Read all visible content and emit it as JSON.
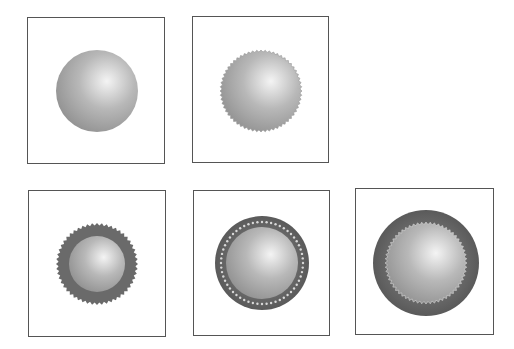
{
  "figure": {
    "colors": {
      "frame": "#555555",
      "sphere_highlight": "#f4f4f4",
      "sphere_mid": "#b8b8b8",
      "sphere_shadow": "#8a8a8a",
      "ring_dark": "#6a6a6a",
      "dot_light": "#d8d8d8"
    },
    "panels": [
      {
        "id": "plain-sphere",
        "box": [
          27,
          17,
          138,
          147
        ],
        "cx": 69,
        "cy": 73,
        "outer_r": 41,
        "inner_r": 0,
        "style": "smooth"
      },
      {
        "id": "serrated-sphere",
        "box": [
          192,
          16,
          137,
          147
        ],
        "cx": 68,
        "cy": 74,
        "outer_r": 41,
        "inner_r": 0,
        "style": "serrated"
      },
      {
        "id": "serrated-ring-small-core",
        "box": [
          28,
          190,
          138,
          147
        ],
        "cx": 68,
        "cy": 73,
        "outer_r": 41,
        "inner_r": 28,
        "style": "serrated-ring"
      },
      {
        "id": "dotted-ring-sphere",
        "box": [
          193,
          190,
          137,
          146
        ],
        "cx": 68,
        "cy": 72,
        "outer_r": 47,
        "inner_r": 36,
        "style": "dotted-ring"
      },
      {
        "id": "smooth-ring-serrated-core",
        "box": [
          355,
          188,
          139,
          147
        ],
        "cx": 70,
        "cy": 74,
        "outer_r": 53,
        "inner_r": 41,
        "style": "smooth-ring-serrated-core"
      }
    ]
  }
}
